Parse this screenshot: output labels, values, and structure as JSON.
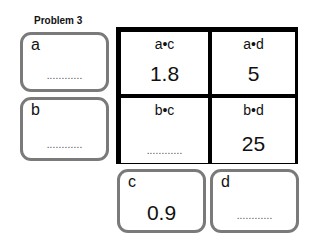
{
  "title": "Problem 3",
  "blank": "............",
  "inputs": {
    "a": {
      "label": "a",
      "value": null
    },
    "b": {
      "label": "b",
      "value": null
    },
    "c": {
      "label": "c",
      "value": "0.9"
    },
    "d": {
      "label": "d",
      "value": null
    }
  },
  "grid": [
    {
      "header": "a•c",
      "value": "1.8"
    },
    {
      "header": "a•d",
      "value": "5"
    },
    {
      "header": "b•c",
      "value": null
    },
    {
      "header": "b•d",
      "value": "25"
    }
  ]
}
